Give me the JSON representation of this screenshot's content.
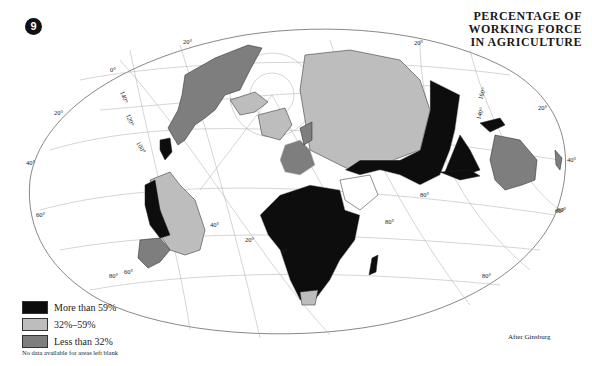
{
  "page": {
    "plate_number": "9",
    "title_lines": [
      "PERCENTAGE OF",
      "WORKING FORCE",
      "IN AGRICULTURE"
    ],
    "credit": "After Ginsburg"
  },
  "legend": {
    "items": [
      {
        "label": "More than 59%",
        "color": "#0d0d0d"
      },
      {
        "label": "32%–59%",
        "color": "#bdbdbd"
      },
      {
        "label": "Less than 32%",
        "color": "#7e7e7e"
      }
    ],
    "note": "No data available for areas left blank"
  },
  "graticule_labels": {
    "top": [
      "0°",
      "20°",
      "20°"
    ],
    "left": [
      "140°",
      "120°",
      "100°",
      "20°",
      "40°",
      "60°"
    ],
    "center": [
      "40°",
      "20°",
      "0°",
      "80°",
      "80°",
      "60°"
    ],
    "right": [
      "160°",
      "140°",
      "20°",
      "40°",
      "60°",
      "80°"
    ],
    "bottom": [
      "80°",
      "60°"
    ]
  },
  "regions": {
    "more_than_59": [
      "Africa",
      "South Asia",
      "China",
      "Southeast Asia",
      "Central America",
      "Andean South America",
      "Madagascar"
    ],
    "between_32_59": [
      "USSR",
      "Brazil",
      "Southern Europe",
      "Arctic Canada",
      "Southern Africa"
    ],
    "less_than_32": [
      "North America",
      "Western Europe",
      "Australia",
      "New Zealand",
      "Argentina",
      "Scandinavia"
    ]
  }
}
